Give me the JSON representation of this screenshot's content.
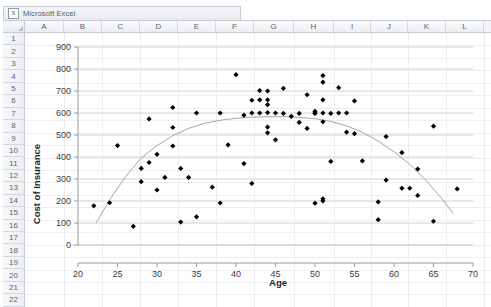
{
  "window": {
    "title": "Microsoft Excel",
    "icon": "excel-icon"
  },
  "spreadsheet": {
    "columns": [
      "A",
      "B",
      "C",
      "D",
      "E",
      "F",
      "G",
      "H",
      "I",
      "J",
      "K",
      "L"
    ],
    "rows": [
      "1",
      "2",
      "3",
      "4",
      "5",
      "6",
      "7",
      "8",
      "9",
      "10",
      "11",
      "12",
      "13",
      "14",
      "15",
      "16",
      "17",
      "18",
      "19",
      "20",
      "21",
      "22"
    ]
  },
  "chart_data": {
    "type": "scatter",
    "title": "",
    "xlabel": "Age",
    "ylabel": "Cost of Insurance",
    "xlim": [
      20,
      70
    ],
    "ylim": [
      0,
      900
    ],
    "xticks": [
      20,
      25,
      30,
      35,
      40,
      45,
      50,
      55,
      60,
      65,
      70
    ],
    "yticks": [
      0,
      100,
      200,
      300,
      400,
      500,
      600,
      700,
      800,
      900
    ],
    "grid": "horizontal",
    "legend": "none",
    "marker": "diamond",
    "marker_color": "#000000",
    "trendline": {
      "type": "polynomial",
      "order": 2,
      "color": "#a6a6a6",
      "x_start": 22.3,
      "x_end": 67.5,
      "vertex_x": 46.5,
      "vertex_y": 583,
      "points": [
        [
          22.3,
          100
        ],
        [
          24,
          205
        ],
        [
          26,
          310
        ],
        [
          28,
          395
        ],
        [
          30,
          452
        ],
        [
          32,
          497
        ],
        [
          34,
          530
        ],
        [
          36,
          553
        ],
        [
          38,
          567
        ],
        [
          40,
          576
        ],
        [
          42,
          581
        ],
        [
          44,
          583
        ],
        [
          46.5,
          583
        ],
        [
          48,
          580
        ],
        [
          50,
          574
        ],
        [
          52,
          562
        ],
        [
          54,
          542
        ],
        [
          56,
          512
        ],
        [
          58,
          472
        ],
        [
          60,
          424
        ],
        [
          62,
          366
        ],
        [
          64,
          296
        ],
        [
          66,
          213
        ],
        [
          67.5,
          143
        ]
      ]
    },
    "series": [
      {
        "name": "Cost of Insurance vs Age",
        "points": [
          [
            22,
            178
          ],
          [
            24,
            192
          ],
          [
            25,
            452
          ],
          [
            27,
            85
          ],
          [
            28,
            288
          ],
          [
            28,
            348
          ],
          [
            29,
            375
          ],
          [
            29,
            573
          ],
          [
            30,
            250
          ],
          [
            30,
            412
          ],
          [
            31,
            307
          ],
          [
            32,
            450
          ],
          [
            32,
            534
          ],
          [
            32,
            625
          ],
          [
            33,
            104
          ],
          [
            33,
            348
          ],
          [
            34,
            307
          ],
          [
            35,
            128
          ],
          [
            35,
            600
          ],
          [
            37,
            263
          ],
          [
            38,
            191
          ],
          [
            38,
            600
          ],
          [
            39,
            455
          ],
          [
            40,
            774
          ],
          [
            41,
            370
          ],
          [
            41,
            590
          ],
          [
            42,
            280
          ],
          [
            42,
            600
          ],
          [
            42,
            658
          ],
          [
            43,
            600
          ],
          [
            43,
            660
          ],
          [
            43,
            702
          ],
          [
            44,
            510
          ],
          [
            44,
            536
          ],
          [
            44,
            602
          ],
          [
            44,
            638
          ],
          [
            44,
            660
          ],
          [
            44,
            700
          ],
          [
            45,
            478
          ],
          [
            45,
            600
          ],
          [
            46,
            598
          ],
          [
            46,
            712
          ],
          [
            47,
            585
          ],
          [
            48,
            557
          ],
          [
            48,
            598
          ],
          [
            49,
            530
          ],
          [
            49,
            683
          ],
          [
            50,
            598
          ],
          [
            50,
            600
          ],
          [
            50,
            608
          ],
          [
            50,
            190
          ],
          [
            51,
            200
          ],
          [
            51,
            210
          ],
          [
            51,
            560
          ],
          [
            51,
            600
          ],
          [
            51,
            660
          ],
          [
            51,
            740
          ],
          [
            51,
            770
          ],
          [
            52,
            598
          ],
          [
            52,
            380
          ],
          [
            53,
            600
          ],
          [
            53,
            715
          ],
          [
            54,
            513
          ],
          [
            54,
            600
          ],
          [
            55,
            506
          ],
          [
            55,
            655
          ],
          [
            56,
            382
          ],
          [
            58,
            115
          ],
          [
            58,
            196
          ],
          [
            59,
            295
          ],
          [
            59,
            493
          ],
          [
            61,
            258
          ],
          [
            61,
            420
          ],
          [
            62,
            258
          ],
          [
            63,
            225
          ],
          [
            63,
            345
          ],
          [
            65,
            108
          ],
          [
            65,
            540
          ],
          [
            68,
            255
          ]
        ]
      }
    ]
  }
}
